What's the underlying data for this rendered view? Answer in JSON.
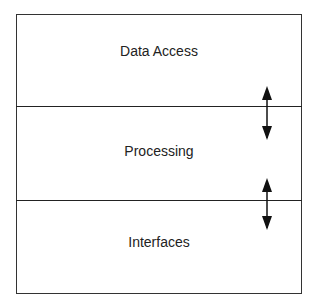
{
  "diagram": {
    "type": "layered-architecture",
    "layers": [
      {
        "label": "Data Access"
      },
      {
        "label": "Processing"
      },
      {
        "label": "Interfaces"
      }
    ],
    "connectors": [
      {
        "between": [
          "Data Access",
          "Processing"
        ],
        "kind": "bidirectional-arrow"
      },
      {
        "between": [
          "Processing",
          "Interfaces"
        ],
        "kind": "bidirectional-arrow"
      }
    ]
  }
}
